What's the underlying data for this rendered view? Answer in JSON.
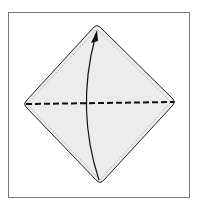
{
  "diagram": {
    "type": "origami-fold-step",
    "frame": {
      "border_color": "#7a7a7a"
    },
    "paper": {
      "fill": "#ececec",
      "stroke": "#222222",
      "shape": "diamond"
    },
    "fold_line": {
      "style": "valley-fold-dashed",
      "color": "#111111"
    },
    "arrow": {
      "direction": "bottom-to-top",
      "color": "#111111"
    }
  }
}
